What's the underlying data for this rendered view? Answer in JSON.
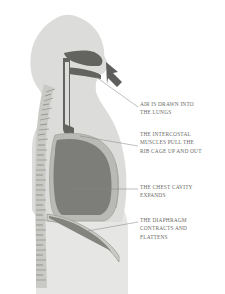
{
  "illustration": {
    "title": "Human respiratory system during inhalation, lateral view",
    "view": "side profile of head, neck and torso",
    "colors": {
      "background": "#ffffff",
      "body_silhouette": "#dcdcda",
      "lower_torso": "#e4e4e2",
      "airway_dark": "#636360",
      "lung": "#7d7d7a",
      "rib_cage_outline": "#b4b4b0",
      "spine": "#c6c6c2",
      "arrow": "#5e5e5c",
      "leader_line": "#8a8a86",
      "label_text": "#6a6a66"
    },
    "parts": [
      {
        "name": "head-silhouette",
        "label": "Head"
      },
      {
        "name": "nasal-cavity",
        "label": "Nasal cavity"
      },
      {
        "name": "oral-cavity",
        "label": "Oral cavity"
      },
      {
        "name": "tongue",
        "label": "Tongue"
      },
      {
        "name": "pharynx",
        "label": "Pharynx"
      },
      {
        "name": "trachea",
        "label": "Trachea"
      },
      {
        "name": "spine",
        "label": "Vertebral column"
      },
      {
        "name": "rib-cage",
        "label": "Rib cage"
      },
      {
        "name": "lung",
        "label": "Lung"
      },
      {
        "name": "diaphragm",
        "label": "Diaphragm"
      },
      {
        "name": "abdomen",
        "label": "Abdomen"
      }
    ],
    "airflow_arrow": {
      "name": "air-inflow-arrow",
      "direction": "up-and-left, toward the mouth",
      "meaning": "air entering the body"
    }
  },
  "callouts": [
    {
      "id": "air",
      "lines": [
        "Air is drawn into",
        "the lungs"
      ],
      "points_to": "mouth and airway"
    },
    {
      "id": "ribs",
      "lines": [
        "The intercostal",
        "muscles pull the",
        "rib cage up and out"
      ],
      "points_to": "rib cage"
    },
    {
      "id": "cavity",
      "lines": [
        "The chest cavity",
        "expands"
      ],
      "points_to": "lung / thoracic cavity"
    },
    {
      "id": "diaphragm",
      "lines": [
        "The diaphragm",
        "contracts and",
        "flattens"
      ],
      "points_to": "diaphragm"
    }
  ]
}
